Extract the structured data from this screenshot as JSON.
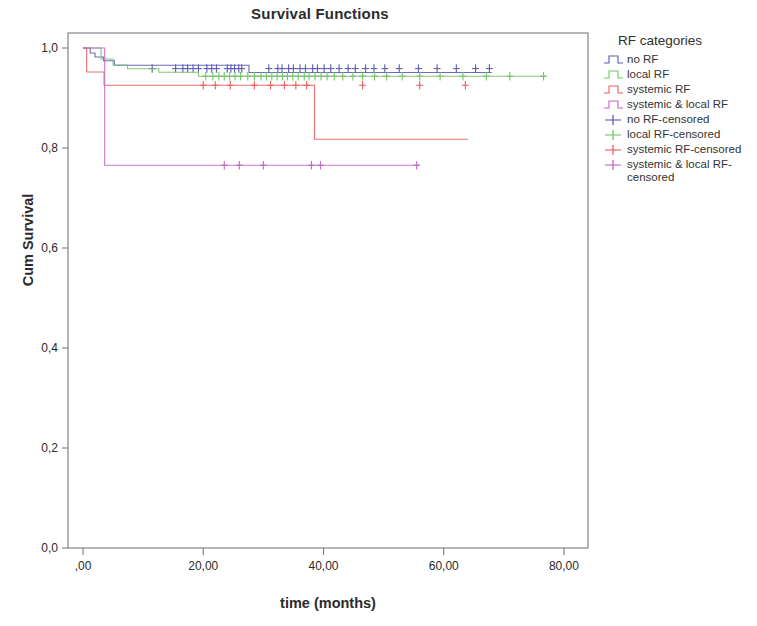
{
  "chart_data": {
    "type": "line",
    "title": "Survival Functions",
    "xlabel": "time (months)",
    "ylabel": "Cum Survival",
    "xlim": [
      -2.5,
      84
    ],
    "ylim": [
      0.0,
      1.03
    ],
    "xticks": [
      0,
      20,
      40,
      60,
      80
    ],
    "xticklabels": [
      ",00",
      "20,00",
      "40,00",
      "60,00",
      "80,00"
    ],
    "yticks": [
      0.0,
      0.2,
      0.4,
      0.6,
      0.8,
      1.0
    ],
    "yticklabels": [
      "0,0",
      "0,2",
      "0,4",
      "0,6",
      "0,8",
      "1,0"
    ],
    "grid": false,
    "legend_position": "right",
    "legend_title": "RF categories",
    "series": [
      {
        "name": "no RF",
        "color": "#5b5bb5",
        "steps": [
          [
            0.0,
            1.0
          ],
          [
            1.2,
            1.0
          ],
          [
            1.2,
            0.99
          ],
          [
            2.0,
            0.99
          ],
          [
            2.0,
            0.982
          ],
          [
            3.4,
            0.982
          ],
          [
            3.4,
            0.9745
          ],
          [
            5.2,
            0.9745
          ],
          [
            5.2,
            0.9655
          ],
          [
            27.6,
            0.9655
          ],
          [
            27.6,
            0.951
          ],
          [
            68.0,
            0.951
          ]
        ],
        "censored_x": [
          11.5,
          15.4,
          16.6,
          17.4,
          18.3,
          19.2,
          20.6,
          21.4,
          22.2,
          24.0,
          24.6,
          25.2,
          25.9,
          26.4,
          30.9,
          32.4,
          33.1,
          34.2,
          35.0,
          36.1,
          37.0,
          38.2,
          39.0,
          40.1,
          41.2,
          42.6,
          44.1,
          45.3,
          47.0,
          48.4,
          50.2,
          52.6,
          55.8,
          58.9,
          62.1,
          65.3,
          67.6
        ],
        "censored_y": 0.9589
      },
      {
        "name": "local RF",
        "color": "#74c36a",
        "steps": [
          [
            0.0,
            1.0
          ],
          [
            3.0,
            1.0
          ],
          [
            3.0,
            0.978
          ],
          [
            5.0,
            0.978
          ],
          [
            5.0,
            0.966
          ],
          [
            7.4,
            0.966
          ],
          [
            7.4,
            0.9585
          ],
          [
            12.6,
            0.9585
          ],
          [
            12.6,
            0.9515
          ],
          [
            19.2,
            0.9515
          ],
          [
            19.2,
            0.9435
          ],
          [
            77.0,
            0.9435
          ]
        ],
        "censored_x": [
          20.4,
          21.6,
          22.6,
          23.5,
          24.4,
          25.3,
          26.2,
          27.4,
          28.5,
          29.6,
          30.5,
          31.4,
          32.3,
          33.2,
          34.0,
          34.9,
          35.8,
          36.8,
          37.6,
          38.6,
          39.6,
          40.6,
          41.8,
          43.2,
          44.9,
          46.5,
          48.5,
          50.5,
          53.1,
          56.0,
          59.4,
          63.2,
          67.1,
          71.0,
          76.6
        ],
        "censored_y": 0.9435
      },
      {
        "name": "systemic RF",
        "color": "#e8605d",
        "steps": [
          [
            0.0,
            1.0
          ],
          [
            0.6,
            1.0
          ],
          [
            0.6,
            0.952
          ],
          [
            3.5,
            0.952
          ],
          [
            3.5,
            0.9255
          ],
          [
            38.5,
            0.9255
          ],
          [
            38.5,
            0.8175
          ],
          [
            64.0,
            0.8175
          ]
        ],
        "censored_x": [
          20.0,
          22.0,
          24.5,
          28.5,
          31.2,
          33.5,
          35.4,
          37.2,
          46.5,
          56.0,
          63.6
        ],
        "censored_y": 0.9255
      },
      {
        "name": "systemic & local RF",
        "color": "#c466c4",
        "steps": [
          [
            0.0,
            1.0
          ],
          [
            3.6,
            1.0
          ],
          [
            3.6,
            0.7655
          ],
          [
            56.0,
            0.7655
          ]
        ],
        "censored_x": [
          23.5,
          26.0,
          30.0,
          38.0,
          39.5,
          55.5
        ],
        "censored_y": 0.7655
      }
    ],
    "legend_entries": [
      {
        "label": "no RF",
        "color": "#5b5bb5",
        "marker": "step"
      },
      {
        "label": "local RF",
        "color": "#74c36a",
        "marker": "step"
      },
      {
        "label": "systemic RF",
        "color": "#e8605d",
        "marker": "step"
      },
      {
        "label": "systemic & local RF",
        "color": "#c466c4",
        "marker": "step"
      },
      {
        "label": "no RF-censored",
        "color": "#5b5bb5",
        "marker": "cross"
      },
      {
        "label": "local RF-censored",
        "color": "#74c36a",
        "marker": "cross"
      },
      {
        "label": "systemic RF-censored",
        "color": "#e8605d",
        "marker": "cross"
      },
      {
        "label": "systemic & local RF-\ncensored",
        "color": "#c466c4",
        "marker": "cross"
      }
    ]
  },
  "colors": {
    "axis": "#6e6e6e",
    "frame": "#7a7a7a",
    "text": "#2b2b2b",
    "background": "#ffffff"
  }
}
